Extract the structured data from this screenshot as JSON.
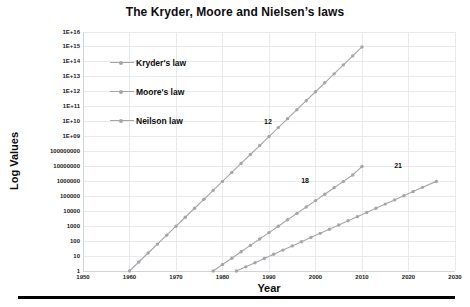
{
  "chart_data": {
    "type": "line",
    "title": "The Kryder, Moore and Nielsen’s laws",
    "xlabel": "Year",
    "ylabel": "Log Values",
    "xlim": [
      1950,
      2030
    ],
    "ylim": [
      1,
      1e+16
    ],
    "yscale": "log",
    "grid": true,
    "legend_position": "inside-upper-left",
    "xticks": [
      "1950",
      "1960",
      "1970",
      "1980",
      "1990",
      "2000",
      "2010",
      "2020",
      "2030"
    ],
    "yticks": [
      "1E+16",
      "1E+15",
      "1E+14",
      "1E+13",
      "1E+12",
      "1E+11",
      "1E+10",
      "1E+09",
      "100000000",
      "10000000",
      "1000000",
      "100000",
      "10000",
      "1000",
      "100",
      "10",
      "1"
    ],
    "annotations": [
      {
        "text": "12",
        "x": 1990,
        "y": 10000000000.0
      },
      {
        "text": "18",
        "x": 1998,
        "y": 1000000
      },
      {
        "text": "21",
        "x": 2018,
        "y": 10000000
      }
    ],
    "series": [
      {
        "name": "Kryder's law",
        "color": "#a6a6a6",
        "annotation": "12",
        "doubling_months": 12,
        "x_start": 1960,
        "x_end": 2010,
        "y_start": 1,
        "y_end": 1000000000000000.0,
        "points": 26,
        "x": [
          1960,
          1962,
          1964,
          1966,
          1968,
          1970,
          1972,
          1974,
          1976,
          1978,
          1980,
          1982,
          1984,
          1986,
          1988,
          1990,
          1992,
          1994,
          1996,
          1998,
          2000,
          2002,
          2004,
          2006,
          2008,
          2010
        ],
        "y": [
          1,
          4,
          16,
          63,
          251,
          1000,
          3981,
          15849,
          63096,
          251189,
          1000000,
          3981072,
          15848932,
          63095734,
          251188643,
          1000000000,
          3981071706,
          15848931925,
          63095734448,
          251188643151,
          1000000000000,
          3981071705535,
          15848931924611,
          63095734448019,
          251188643150958,
          1000000000000000
        ]
      },
      {
        "name": "Moore's law",
        "color": "#a6a6a6",
        "annotation": "18",
        "doubling_months": 18,
        "x_start": 1978,
        "x_end": 2010,
        "y_start": 1,
        "y_end": 10000000,
        "points": 17,
        "x": [
          1978,
          1980,
          1982,
          1984,
          1986,
          1988,
          1990,
          1992,
          1994,
          1996,
          1998,
          2000,
          2002,
          2004,
          2006,
          2008,
          2010
        ],
        "y": [
          1,
          2.7,
          7.2,
          19.3,
          51.8,
          139,
          373,
          1000,
          2683,
          7197,
          19307,
          51795,
          138950,
          372759,
          1000000,
          2682696,
          10000000
        ]
      },
      {
        "name": "Neilson law",
        "color": "#a6a6a6",
        "annotation": "21",
        "doubling_months": 21,
        "x_start": 1983,
        "x_end": 2026,
        "y_start": 1,
        "y_end": 1000000,
        "points": 22,
        "x": [
          1983,
          1985,
          1987,
          1989,
          1991,
          1993,
          1995,
          1997,
          1999,
          2001,
          2003,
          2005,
          2007,
          2009,
          2011,
          2013,
          2015,
          2017,
          2019,
          2021,
          2023,
          2026
        ],
        "y": [
          1,
          1.9,
          3.6,
          6.9,
          13.2,
          25.1,
          47.9,
          91.2,
          173.8,
          331.1,
          630.9,
          1202,
          2290,
          4365,
          8318,
          15849,
          30200,
          57544,
          109648,
          208930,
          398107,
          1000000
        ]
      }
    ]
  },
  "legend": {
    "items": [
      {
        "label": "Kryder's law"
      },
      {
        "label": "Moore's law"
      },
      {
        "label": "Neilson law"
      }
    ]
  },
  "colors": {
    "series": "#a6a6a6",
    "grid": "#e8eaee",
    "axis": "#d0d3d8",
    "text": "#0d0d0d",
    "rule": "#000000"
  }
}
